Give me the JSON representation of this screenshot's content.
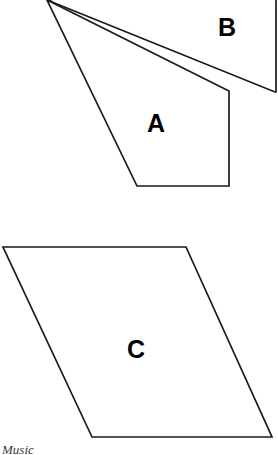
{
  "figure": {
    "background_color": "#ffffff",
    "stroke_color": "#1a1a1a",
    "label_color": "#000000",
    "width": 278,
    "height": 455,
    "shapes": [
      {
        "id": "shape-b",
        "label": "B",
        "kind": "quadrilateral",
        "label_x": 227,
        "label_y": 27,
        "points": "47,0 100,-6 276,-6 276,92 275,92",
        "note": "clipped at top edge of image"
      },
      {
        "id": "shape-a",
        "label": "A",
        "kind": "quadrilateral",
        "label_x": 156,
        "label_y": 123,
        "points": "47,0 229,91 229,186 137,186",
        "note": "clipped at top edge of image"
      },
      {
        "id": "shape-c",
        "label": "C",
        "kind": "parallelogram",
        "label_x": 136,
        "label_y": 349,
        "points": "3,247 186,247 272,437 92,437",
        "note": ""
      }
    ]
  },
  "caption": {
    "text": "Music"
  }
}
